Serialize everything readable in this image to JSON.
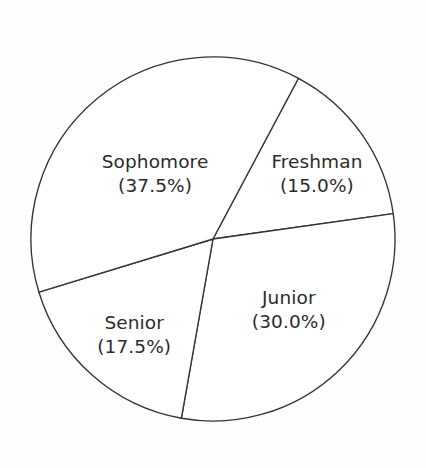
{
  "figure": {
    "background_color": "#fefefe",
    "stroke_color": "#333333",
    "text_color": "#2b2b2b",
    "fill_color": "#ffffff"
  },
  "chart_data": {
    "type": "pie",
    "title": "",
    "subtitle": "",
    "xlabel": "",
    "ylabel": "",
    "legend_position": "none",
    "grid": false,
    "labels_inside_slices": true,
    "total_percent": "100.0%",
    "start_angle_deg": 28,
    "direction": "clockwise",
    "categories": [
      "Freshman",
      "Junior",
      "Senior",
      "Sophomore"
    ],
    "values": [
      15.0,
      30.0,
      17.5,
      37.5
    ],
    "slices": [
      {
        "name": "Freshman",
        "value": 15.0,
        "label": "Freshman",
        "percent_label": "(15.0%)",
        "start_angle_deg": 28,
        "end_angle_deg": 82,
        "label_x_pct": 74.4,
        "label_y_pct": 37.2
      },
      {
        "name": "Junior",
        "value": 30.0,
        "label": "Junior",
        "percent_label": "(30.0%)",
        "start_angle_deg": 82,
        "end_angle_deg": 190,
        "label_x_pct": 67.8,
        "label_y_pct": 66.2
      },
      {
        "name": "Senior",
        "value": 17.5,
        "label": "Senior",
        "percent_label": "(17.5%)",
        "start_angle_deg": 190,
        "end_angle_deg": 253,
        "label_x_pct": 31.5,
        "label_y_pct": 71.6
      },
      {
        "name": "Sophomore",
        "value": 37.5,
        "label": "Sophomore",
        "percent_label": "(37.5%)",
        "start_angle_deg": 253,
        "end_angle_deg": 388,
        "label_x_pct": 36.4,
        "label_y_pct": 37.2
      }
    ],
    "geometry": {
      "center_x": 213,
      "center_y": 239,
      "radius": 182
    }
  }
}
